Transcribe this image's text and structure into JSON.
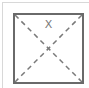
{
  "placeholder": {
    "label": "X",
    "border_color": "#6a6a6a",
    "diagonal_color": "#7a7a7a",
    "frame_color": "#d8d8d8"
  }
}
